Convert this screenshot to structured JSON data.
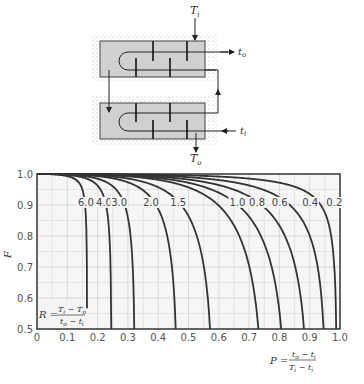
{
  "diagram": {
    "labels": {
      "shell_in": "T",
      "shell_in_sub": "i",
      "shell_out": "T",
      "shell_out_sub": "o",
      "tube_in": "t",
      "tube_in_sub": "i",
      "tube_out": "t",
      "tube_out_sub": "o"
    }
  },
  "chart_data": {
    "type": "line",
    "title": "",
    "xlabel": "P = (t_o - t_i)/(T_i - t_i)",
    "ylabel": "F",
    "xlim": [
      0,
      1.0
    ],
    "ylim": [
      0.5,
      1.0
    ],
    "grid": true,
    "x_ticks": [
      "0",
      "0.1",
      "0.2",
      "0.3",
      "0.4",
      "0.5",
      "0.6",
      "0.7",
      "0.8",
      "0.9",
      "1.0"
    ],
    "y_ticks": [
      "0.5",
      "0.6",
      "0.7",
      "0.8",
      "0.9",
      "1.0"
    ],
    "annotation_R": "R = (T_i - T_o)/(t_o - t_i)",
    "series": [
      {
        "name": "6.0",
        "label_pos": [
          0.135,
          0.91
        ]
      },
      {
        "name": "4.0",
        "label_pos": [
          0.195,
          0.91
        ]
      },
      {
        "name": "3.0",
        "label_pos": [
          0.245,
          0.91
        ]
      },
      {
        "name": "2.0",
        "label_pos": [
          0.35,
          0.91
        ]
      },
      {
        "name": "1.5",
        "label_pos": [
          0.44,
          0.91
        ]
      },
      {
        "name": "1.0",
        "label_pos": [
          0.635,
          0.91
        ]
      },
      {
        "name": "0.8",
        "label_pos": [
          0.7,
          0.91
        ]
      },
      {
        "name": "0.6",
        "label_pos": [
          0.775,
          0.91
        ]
      },
      {
        "name": "0.4",
        "label_pos": [
          0.875,
          0.91
        ]
      },
      {
        "name": "0.2",
        "label_pos": [
          0.955,
          0.91
        ]
      }
    ],
    "approx_P_at_F_0_5": {
      "6.0": 0.17,
      "4.0": 0.25,
      "3.0": 0.32,
      "2.0": 0.45,
      "1.5": 0.565,
      "1.0": 0.745,
      "0.8": 0.8,
      "0.6": 0.875,
      "0.4": 0.935,
      "0.2": 0.98
    }
  }
}
